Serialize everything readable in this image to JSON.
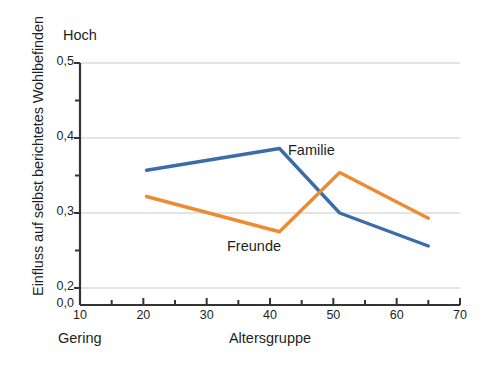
{
  "chart_data": {
    "type": "line",
    "title": "",
    "xlabel": "Altersgruppe",
    "ylabel": "Einfluss auf selbst berichtetes Wohlbefinden",
    "xlim": [
      10,
      70
    ],
    "ylim": [
      0.2,
      0.5
    ],
    "y_axis_break_label": "0,0",
    "grid": true,
    "grid_axis": "y",
    "legend_position": "inline-annotations",
    "axis_annotations": {
      "y_top": "Hoch",
      "y_bottom": "Gering"
    },
    "x_ticks": [
      10,
      20,
      30,
      40,
      50,
      60,
      70
    ],
    "x_tick_labels": [
      "10",
      "20",
      "30",
      "40",
      "50",
      "60",
      "70"
    ],
    "x_minor_ticks": [
      15,
      25,
      35,
      45,
      55,
      65
    ],
    "y_ticks": [
      0.2,
      0.3,
      0.4,
      0.5
    ],
    "y_tick_labels": [
      "0,2",
      "0,3",
      "0,4",
      "0,5"
    ],
    "y_minor_ticks": [
      0.25,
      0.35,
      0.45
    ],
    "series": [
      {
        "name": "Familie",
        "color": "#3C6CA8",
        "x": [
          20.5,
          41.5,
          51.0,
          65.0
        ],
        "values": [
          0.357,
          0.386,
          0.3,
          0.256
        ]
      },
      {
        "name": "Freunde",
        "color": "#ED8B31",
        "x": [
          20.5,
          41.5,
          51.0,
          65.0
        ],
        "values": [
          0.322,
          0.275,
          0.354,
          0.293
        ]
      }
    ]
  },
  "labels": {
    "y_axis_title": "Einfluss auf selbst berichtetes Wohlbefinden",
    "x_axis_title": "Altersgruppe",
    "high_caption": "Hoch",
    "low_caption": "Gering",
    "series_familie": "Familie",
    "series_freunde": "Freunde"
  },
  "colors": {
    "familie": "#3C6CA8",
    "freunde": "#ED8B31",
    "axis": "#333333",
    "grid": "#c9c9c9",
    "text": "#221f1f",
    "background": "#ffffff"
  }
}
